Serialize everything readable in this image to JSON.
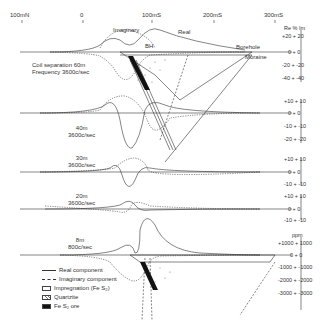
{
  "top_axis": {
    "ticks": [
      {
        "label": "100mN",
        "x": 22
      },
      {
        "label": "0",
        "x": 83
      },
      {
        "label": "100mS",
        "x": 152
      },
      {
        "label": "200mS",
        "x": 214
      },
      {
        "label": "300mS",
        "x": 275
      }
    ]
  },
  "annotations": {
    "imaginary": "Imaginary",
    "real": "Real",
    "bh": "BH",
    "borehole": "Borehole",
    "moraine": "Moraine"
  },
  "profiles": [
    {
      "id": "p60",
      "label_line1": "Coil separation 60m",
      "label_line2": "Frequency   3600c/sec"
    },
    {
      "id": "p40",
      "label_line1": "40m",
      "label_line2": "3600c/sec"
    },
    {
      "id": "p30",
      "label_line1": "30m",
      "label_line2": "3600c/sec"
    },
    {
      "id": "p20",
      "label_line1": "20m",
      "label_line2": "3600c/sec"
    },
    {
      "id": "p8",
      "label_line1": "8m",
      "label_line2": "800c/sec"
    }
  ],
  "scales": {
    "s60": {
      "header": "Re % Im",
      "ticks": [
        "+20 + 20",
        "0 + 0",
        "-20 + -20",
        "-40 + -40"
      ]
    },
    "s40": {
      "ticks": [
        "+10 + 10",
        "0 + 0",
        "-10 + -10",
        "-20 + -20"
      ]
    },
    "s30": {
      "ticks": [
        "+10 + 10",
        "0 + 0",
        "-10 + -10"
      ]
    },
    "s20": {
      "ticks": [
        "+10 + 10",
        "0 + 0",
        "-10 + -10"
      ]
    },
    "s8": {
      "header": "ppm",
      "ticks": [
        "+1000 + 1000",
        "0 + 0",
        "-1000 + -1000",
        "-2000 + -2000",
        "-3000 + -3000"
      ]
    }
  },
  "legend": {
    "items": [
      {
        "symbol": "solid-line",
        "label": "Real component"
      },
      {
        "symbol": "dotted-line",
        "label": "Imaginary component"
      },
      {
        "symbol": "dots-box",
        "label": "Impregnation (Fe S₂)"
      },
      {
        "symbol": "v-box",
        "label": "Quartzite"
      },
      {
        "symbol": "black-box",
        "label": "Fe S₂ ore"
      }
    ]
  },
  "colors": {
    "line": "#333333",
    "ore": "#111111",
    "background": "#ffffff"
  }
}
